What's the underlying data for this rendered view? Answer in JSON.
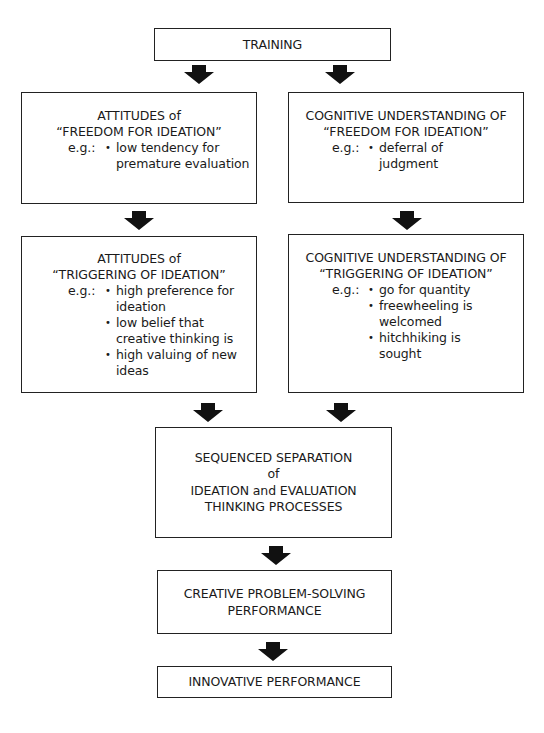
{
  "diagram": {
    "nodes": {
      "training": {
        "lines": [
          "TRAINING"
        ]
      },
      "attitudes_freedom": {
        "lines": [
          "ATTITUDES of",
          "“FREEDOM FOR IDEATION”"
        ],
        "eg_label": "e.g.:",
        "examples": [
          "low tendency for premature evaluation"
        ],
        "example_lines": [
          [
            "low tendency for",
            "premature evaluation"
          ]
        ]
      },
      "cognitive_freedom": {
        "lines": [
          "COGNITIVE UNDERSTANDING OF",
          "“FREEDOM FOR IDEATION”"
        ],
        "eg_label": "e.g.:",
        "examples": [
          "deferral of judgment"
        ],
        "example_lines": [
          [
            "deferral of",
            "judgment"
          ]
        ]
      },
      "attitudes_triggering": {
        "lines": [
          "ATTITUDES of",
          "“TRIGGERING OF IDEATION”"
        ],
        "eg_label": "e.g.:",
        "examples": [
          "high preference for ideation",
          "low belief that creative thinking is",
          "high valuing of new ideas"
        ],
        "example_lines": [
          [
            "high preference for",
            "ideation"
          ],
          [
            "low belief that",
            "creative thinking is"
          ],
          [
            "high valuing of new",
            "ideas"
          ]
        ]
      },
      "cognitive_triggering": {
        "lines": [
          "COGNITIVE UNDERSTANDING OF",
          "“TRIGGERING OF IDEATION”"
        ],
        "eg_label": "e.g.:",
        "examples": [
          "go for quantity",
          "freewheeling is welcomed",
          "hitchhiking is sought"
        ],
        "example_lines": [
          [
            "go for quantity"
          ],
          [
            "freewheeling is",
            "welcomed"
          ],
          [
            "hitchhiking is",
            "sought"
          ]
        ]
      },
      "sequenced_separation": {
        "lines": [
          "SEQUENCED SEPARATION",
          "of",
          "IDEATION and EVALUATION",
          "THINKING PROCESSES"
        ]
      },
      "creative_performance": {
        "lines": [
          "CREATIVE PROBLEM-SOLVING",
          "PERFORMANCE"
        ]
      },
      "innovative_performance": {
        "lines": [
          "INNOVATIVE PERFORMANCE"
        ]
      }
    },
    "edges": [
      {
        "from": "training",
        "to": "attitudes_freedom"
      },
      {
        "from": "training",
        "to": "cognitive_freedom"
      },
      {
        "from": "attitudes_freedom",
        "to": "attitudes_triggering"
      },
      {
        "from": "cognitive_freedom",
        "to": "cognitive_triggering"
      },
      {
        "from": "attitudes_triggering",
        "to": "sequenced_separation"
      },
      {
        "from": "cognitive_triggering",
        "to": "sequenced_separation"
      },
      {
        "from": "sequenced_separation",
        "to": "creative_performance"
      },
      {
        "from": "creative_performance",
        "to": "innovative_performance"
      }
    ],
    "colors": {
      "border": "#222222",
      "arrow": "#111111",
      "background": "#ffffff"
    }
  }
}
